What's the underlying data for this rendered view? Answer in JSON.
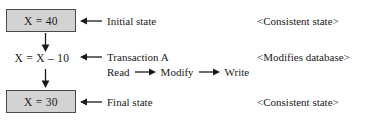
{
  "diagram": {
    "colors": {
      "box_fill": "#d3d3d3",
      "box_border": "#4a4a4a",
      "text": "#1a1a1a",
      "background": "#ffffff"
    },
    "states": {
      "initial_value": "X = 40",
      "operation": "X = X – 10",
      "final_value": "X = 30"
    },
    "callouts": {
      "initial_label": "Initial state",
      "transaction_label": "Transaction A",
      "final_label": "Final state"
    },
    "steps": {
      "read": "Read",
      "modify": "Modify",
      "write": "Write"
    },
    "annotations": {
      "top": "<Consistent state>",
      "middle": "<Modifies database>",
      "bottom": "<Consistent state>"
    },
    "icons": {
      "arrow_left": "arrow-left-icon",
      "arrow_right": "arrow-right-icon",
      "arrow_down": "arrow-down-icon"
    }
  }
}
